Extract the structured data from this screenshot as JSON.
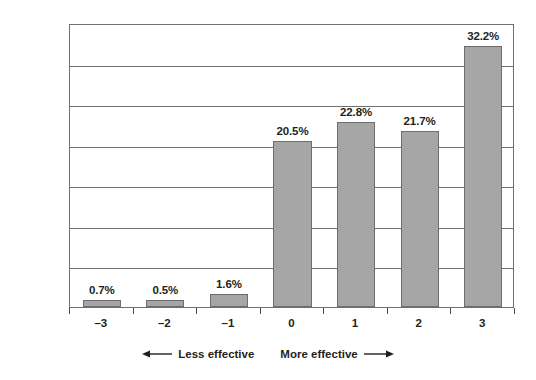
{
  "chart_data": {
    "type": "bar",
    "title": "",
    "subtitle": "",
    "xlabel": "",
    "ylabel": "",
    "categories": [
      "–3",
      "–2",
      "–1",
      "0",
      "1",
      "2",
      "3"
    ],
    "values": [
      0.7,
      0.5,
      1.6,
      20.5,
      22.8,
      21.7,
      32.2
    ],
    "value_labels": [
      "0.7%",
      "0.5%",
      "1.6%",
      "20.5%",
      "22.8%",
      "21.7%",
      "32.2%"
    ],
    "ylim": [
      0,
      35
    ],
    "ytick_values": [
      0,
      5,
      10,
      15,
      20,
      25,
      30,
      35
    ],
    "ytick_labels": [
      "0.0%",
      "5.0%",
      "10.0%",
      "15.0%",
      "20.0%",
      "25.0%",
      "30.0%",
      "35.0%"
    ],
    "grid": true,
    "legend": false,
    "bar_color": "#a6a6a6",
    "bar_border_color": "#6d6d6d",
    "grid_color": "#6f6f6f",
    "text_color": "#231f20",
    "background": "#ffffff",
    "annotations": [
      {
        "name": "less-effective",
        "text": "Less effective",
        "arrow": "left"
      },
      {
        "name": "more-effective",
        "text": "More effective",
        "arrow": "right"
      }
    ]
  }
}
